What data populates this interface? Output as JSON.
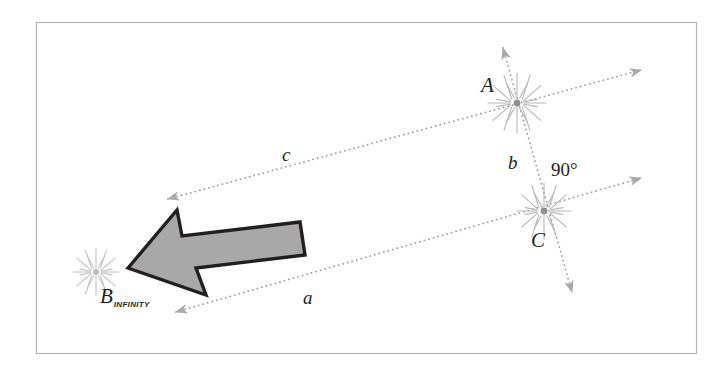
{
  "figure": {
    "border_color": "#b4b4b4",
    "background": "#ffffff",
    "line_color": "#9a9a9a",
    "arrow_fill": "#a8a8a8",
    "arrow_stroke": "#231f20",
    "text_color": "#231f20",
    "starburst_color": "#b0b0b0"
  },
  "points": [
    {
      "id": "A",
      "label": "A",
      "x": 517,
      "y": 103
    },
    {
      "id": "C",
      "label": "C",
      "x": 544,
      "y": 211
    },
    {
      "id": "B",
      "label": "B",
      "subscript": "INFINITY",
      "x": 96,
      "y": 272
    }
  ],
  "labels": {
    "point_a": "A",
    "point_c": "C",
    "point_b": "B",
    "point_b_subscript": "INFINITY",
    "side_a": "a",
    "side_b": "b",
    "side_c": "c",
    "angle": "90°"
  },
  "lines": [
    {
      "name": "line-c",
      "from": "B-infinity",
      "to": "A",
      "label": "c",
      "arrowheads": "both"
    },
    {
      "name": "line-a",
      "from": "B-infinity",
      "to": "C",
      "label": "a",
      "arrowheads": "both"
    },
    {
      "name": "line-b",
      "from": "A",
      "to": "C",
      "label": "b",
      "arrowheads": "both"
    }
  ],
  "arrow": {
    "name": "direction-arrow",
    "direction": "left",
    "fill": "#a8a8a8",
    "stroke": "#231f20"
  }
}
